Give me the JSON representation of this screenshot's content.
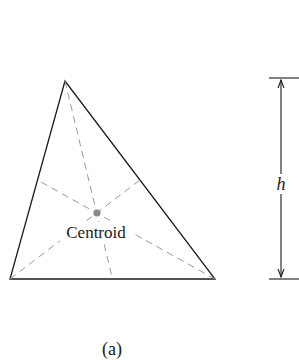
{
  "figure": {
    "centroid_label": "Centroid",
    "height_label": "h",
    "caption": "(a)"
  },
  "colors": {
    "stroke": "#1a1a1a",
    "dashed": "#9a9a9a",
    "centroid_dot": "#8a8a8a"
  }
}
